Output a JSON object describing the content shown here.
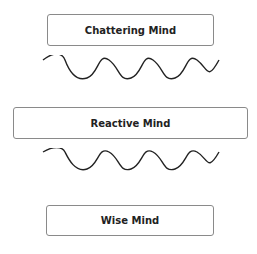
{
  "diagram": {
    "boxes": [
      {
        "label": "Chattering Mind"
      },
      {
        "label": "Reactive Mind"
      },
      {
        "label": "Wise Mind"
      }
    ],
    "connectors": [
      {
        "type": "wave",
        "from": "Chattering Mind",
        "to": "Reactive Mind"
      },
      {
        "type": "wave",
        "from": "Reactive Mind",
        "to": "Wise Mind"
      }
    ],
    "colors": {
      "border": "#8a8a8a",
      "text": "#222222",
      "wave": "#222222"
    }
  }
}
